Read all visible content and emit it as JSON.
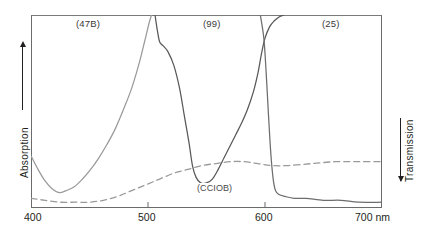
{
  "chart_data": {
    "type": "line",
    "title": "",
    "xlabel": "nm",
    "ylabel_left": "Absorption",
    "ylabel_right": "Transmission",
    "xlim": [
      400,
      700
    ],
    "ylim": [
      0,
      100
    ],
    "grid": false,
    "legend_position": "inline-top",
    "x_ticks": [
      {
        "value": 400,
        "label": "400"
      },
      {
        "value": 500,
        "label": "500"
      },
      {
        "value": 600,
        "label": "600"
      },
      {
        "value": 700,
        "label": "700 nm"
      }
    ],
    "band_labels": [
      {
        "name": "filter-47b",
        "label": "(47B)",
        "x": 448
      },
      {
        "name": "filter-99",
        "label": "(99)",
        "x": 557
      },
      {
        "name": "filter-25",
        "label": "(25)",
        "x": 659
      }
    ],
    "series": [
      {
        "name": "(47B)",
        "style": "solid",
        "color": "#9a9a9a",
        "points": [
          [
            400,
            73
          ],
          [
            406,
            80
          ],
          [
            412,
            86
          ],
          [
            418,
            90
          ],
          [
            424,
            92
          ],
          [
            430,
            91
          ],
          [
            437,
            89
          ],
          [
            444,
            85
          ],
          [
            451,
            80
          ],
          [
            458,
            74
          ],
          [
            465,
            67
          ],
          [
            472,
            59
          ],
          [
            479,
            49
          ],
          [
            486,
            38
          ],
          [
            492,
            26
          ],
          [
            497,
            14
          ],
          [
            501,
            4
          ],
          [
            503,
            0
          ]
        ]
      },
      {
        "name": "(99)",
        "style": "solid",
        "color": "#58585a",
        "points": [
          [
            506,
            0
          ],
          [
            508,
            8
          ],
          [
            510,
            14
          ],
          [
            513,
            16
          ],
          [
            517,
            19
          ],
          [
            522,
            26
          ],
          [
            527,
            38
          ],
          [
            531,
            52
          ],
          [
            535,
            66
          ],
          [
            538,
            78
          ],
          [
            541,
            84
          ],
          [
            545,
            87
          ],
          [
            550,
            87
          ],
          [
            555,
            85
          ],
          [
            560,
            80
          ],
          [
            565,
            74
          ],
          [
            570,
            68
          ],
          [
            575,
            62
          ],
          [
            580,
            56
          ],
          [
            585,
            49
          ],
          [
            590,
            40
          ],
          [
            594,
            30
          ],
          [
            597,
            20
          ],
          [
            600,
            12
          ],
          [
            604,
            6
          ],
          [
            608,
            3
          ],
          [
            612,
            1
          ],
          [
            616,
            0
          ]
        ]
      },
      {
        "name": "(25)",
        "style": "solid",
        "color": "#6d6d6f",
        "points": [
          [
            596,
            0
          ],
          [
            599,
            12
          ],
          [
            601,
            30
          ],
          [
            603,
            52
          ],
          [
            605,
            72
          ],
          [
            607,
            85
          ],
          [
            609,
            91
          ],
          [
            612,
            93
          ],
          [
            617,
            94
          ],
          [
            625,
            95
          ],
          [
            635,
            95
          ],
          [
            650,
            96
          ],
          [
            665,
            96
          ],
          [
            680,
            97
          ],
          [
            700,
            97
          ]
        ]
      },
      {
        "name": "(CCIOB)",
        "style": "dashed",
        "color": "#9a9a9a",
        "points": [
          [
            400,
            95
          ],
          [
            412,
            96
          ],
          [
            425,
            97
          ],
          [
            438,
            97
          ],
          [
            450,
            97
          ],
          [
            462,
            96
          ],
          [
            474,
            94
          ],
          [
            486,
            91
          ],
          [
            498,
            88
          ],
          [
            510,
            85
          ],
          [
            522,
            82
          ],
          [
            534,
            80
          ],
          [
            546,
            78
          ],
          [
            558,
            77
          ],
          [
            570,
            76
          ],
          [
            582,
            76
          ],
          [
            594,
            77
          ],
          [
            606,
            78
          ],
          [
            620,
            78
          ],
          [
            640,
            77
          ],
          [
            660,
            76
          ],
          [
            680,
            76
          ],
          [
            700,
            76
          ]
        ]
      }
    ],
    "annotations": [
      {
        "name": "dashed-curve-label",
        "text": "(CCIOB)",
        "x": 568,
        "y": 80
      }
    ]
  },
  "chart": {
    "bands": {
      "left": "(47B)",
      "middle": "(99)",
      "right": "(25)"
    },
    "inline_label": "(CCIOB)",
    "x_axis": {
      "tick_400": "400",
      "tick_500": "500",
      "tick_600": "600",
      "tick_700": "700 nm"
    },
    "y_axis": {
      "left": "Absorption",
      "right": "Transmission"
    }
  }
}
